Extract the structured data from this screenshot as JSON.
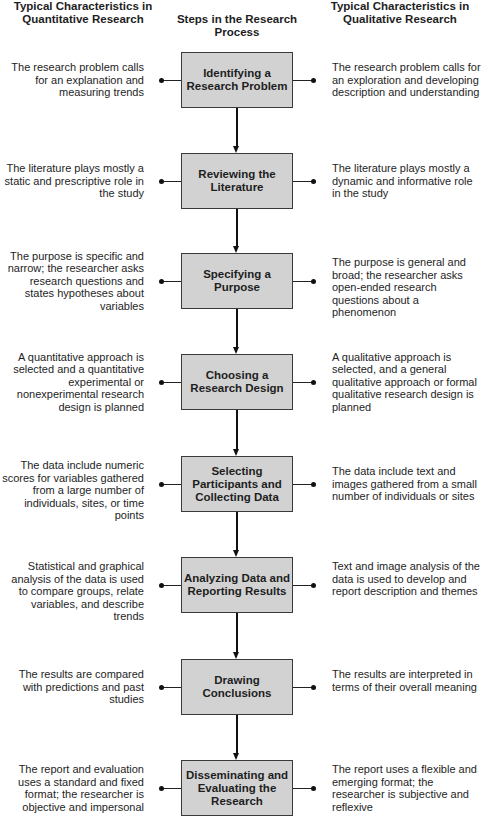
{
  "headers": {
    "left": "Typical Characteristics in Quantitative Research",
    "middle": "Steps in the Research Process",
    "right": "Typical Characteristics in Qualitative Research"
  },
  "steps": [
    {
      "label": "Identifying a Research Problem",
      "quantitative": "The research problem calls for an explanation and measuring trends",
      "qualitative": "The research problem calls for an exploration and developing description and understanding"
    },
    {
      "label": "Reviewing the Literature",
      "quantitative": "The literature plays mostly a static and prescriptive role in the study",
      "qualitative": "The literature plays mostly a dynamic and informative role in the study"
    },
    {
      "label": "Specifying a Purpose",
      "quantitative": "The purpose is specific and narrow; the researcher asks research questions and states hypotheses about variables",
      "qualitative": "The purpose is general and broad; the researcher asks open-ended research questions about a phenomenon"
    },
    {
      "label": "Choosing a Research Design",
      "quantitative": "A quantitative approach is selected and a quantitative experimental or nonexperimental research design is planned",
      "qualitative": "A qualitative approach is selected, and a general qualitative approach or formal qualitative research design is planned"
    },
    {
      "label": "Selecting Participants and Collecting Data",
      "quantitative": "The data include numeric scores for variables gathered from a large number of individuals, sites, or time points",
      "qualitative": "The data include text and images gathered from a small number of individuals or sites"
    },
    {
      "label": "Analyzing Data and Reporting Results",
      "quantitative": "Statistical and graphical analysis of the data is used to compare groups, relate variables, and describe trends",
      "qualitative": "Text and image analysis of the data is used to develop and report description and themes"
    },
    {
      "label": "Drawing Conclusions",
      "quantitative": "The results are compared with predictions and past studies",
      "qualitative": "The results are interpreted in terms of their overall meaning"
    },
    {
      "label": "Disseminating and Evaluating the Research",
      "quantitative": "The report and evaluation uses a standard and fixed format; the researcher is objective and impersonal",
      "qualitative": "The report uses a flexible and emerging format; the researcher is subjective and reflexive"
    }
  ]
}
